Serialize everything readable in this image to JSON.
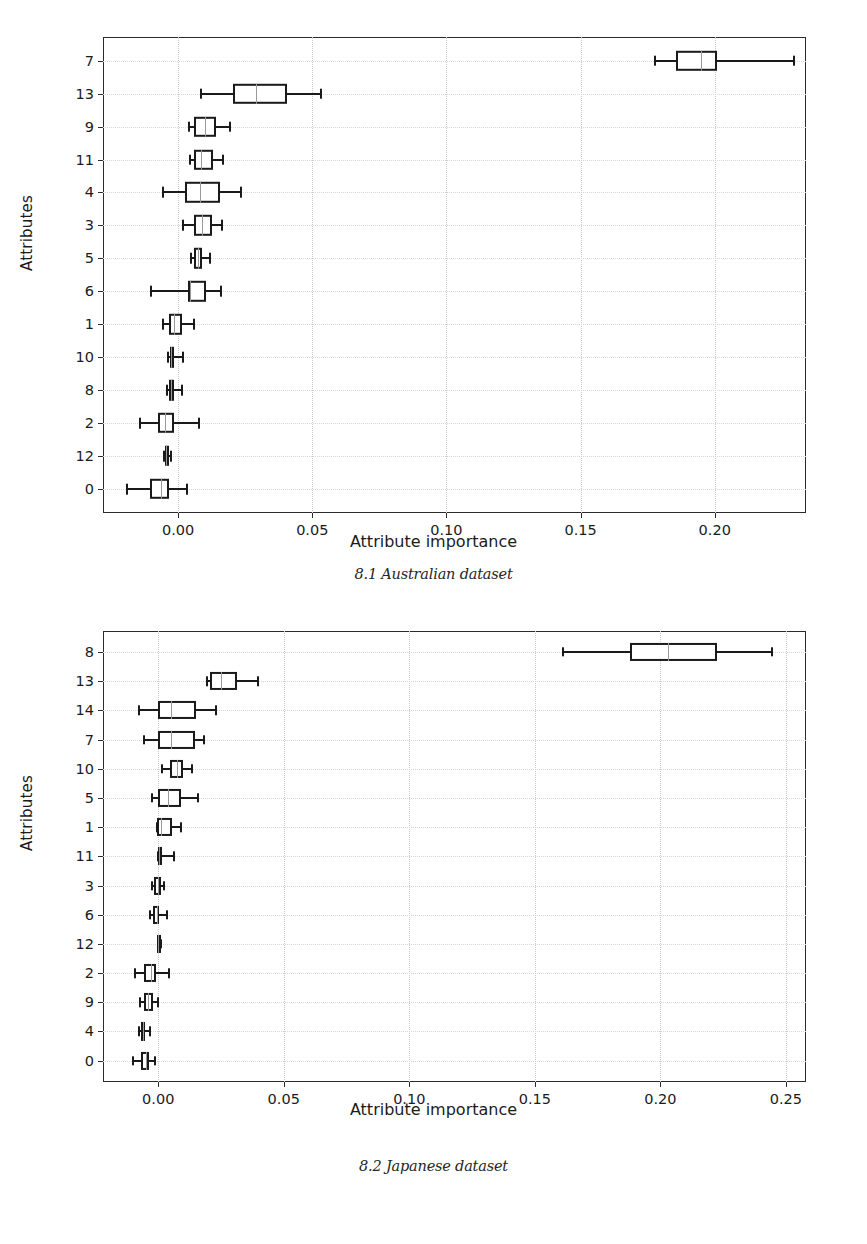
{
  "page": {
    "background": "#ffffff",
    "line_color": "#1a1a1a",
    "grid_color": "#cfcfcf"
  },
  "figures": [
    {
      "id": "australian",
      "caption": "8.1 Australian dataset",
      "xlabel": "Attribute importance",
      "ylabel": "Attributes",
      "chart_data": {
        "type": "box",
        "orientation": "horizontal",
        "title": "",
        "xlabel": "Attribute importance",
        "ylabel": "Attributes",
        "xlim": [
          -0.028,
          0.234
        ],
        "xticks": [
          0.0,
          0.05,
          0.1,
          0.15,
          0.2
        ],
        "xticklabels": [
          "0.00",
          "0.05",
          "0.10",
          "0.15",
          "0.20"
        ],
        "grid": true,
        "categories": [
          "7",
          "13",
          "9",
          "11",
          "4",
          "3",
          "5",
          "6",
          "1",
          "10",
          "8",
          "2",
          "12",
          "0"
        ],
        "boxes": [
          {
            "category": "7",
            "whisker_low": 0.1775,
            "q1": 0.1855,
            "median": 0.195,
            "q3": 0.201,
            "whisker_high": 0.229
          },
          {
            "category": "13",
            "whisker_low": 0.008,
            "q1": 0.0205,
            "median": 0.029,
            "q3": 0.0405,
            "whisker_high": 0.053
          },
          {
            "category": "9",
            "whisker_low": 0.0035,
            "q1": 0.006,
            "median": 0.01,
            "q3": 0.014,
            "whisker_high": 0.019
          },
          {
            "category": "11",
            "whisker_low": 0.004,
            "q1": 0.006,
            "median": 0.0085,
            "q3": 0.013,
            "whisker_high": 0.0165
          },
          {
            "category": "4",
            "whisker_low": -0.006,
            "q1": 0.0025,
            "median": 0.008,
            "q3": 0.0155,
            "whisker_high": 0.023
          },
          {
            "category": "3",
            "whisker_low": 0.0015,
            "q1": 0.006,
            "median": 0.009,
            "q3": 0.0125,
            "whisker_high": 0.016
          },
          {
            "category": "5",
            "whisker_low": 0.0045,
            "q1": 0.006,
            "median": 0.0075,
            "q3": 0.009,
            "whisker_high": 0.0115
          },
          {
            "category": "6",
            "whisker_low": -0.0105,
            "q1": 0.0035,
            "median": 0.0045,
            "q3": 0.0105,
            "whisker_high": 0.0155
          },
          {
            "category": "1",
            "whisker_low": -0.006,
            "q1": -0.0035,
            "median": -0.0015,
            "q3": 0.0015,
            "whisker_high": 0.0055
          },
          {
            "category": "10",
            "whisker_low": -0.004,
            "q1": -0.003,
            "median": -0.0025,
            "q3": -0.0015,
            "whisker_high": 0.0015
          },
          {
            "category": "8",
            "whisker_low": -0.0045,
            "q1": -0.0035,
            "median": -0.0025,
            "q3": -0.0015,
            "whisker_high": 0.001
          },
          {
            "category": "2",
            "whisker_low": -0.0145,
            "q1": -0.0075,
            "median": -0.005,
            "q3": -0.0015,
            "whisker_high": 0.0075
          },
          {
            "category": "12",
            "whisker_low": -0.0055,
            "q1": -0.005,
            "median": -0.0045,
            "q3": -0.0035,
            "whisker_high": -0.003
          },
          {
            "category": "0",
            "whisker_low": -0.0195,
            "q1": -0.0105,
            "median": -0.0065,
            "q3": -0.0035,
            "whisker_high": 0.003
          }
        ]
      }
    },
    {
      "id": "japanese",
      "caption": "8.2 Japanese dataset",
      "xlabel": "Attribute importance",
      "ylabel": "Attributes",
      "chart_data": {
        "type": "box",
        "orientation": "horizontal",
        "title": "",
        "xlabel": "Attribute importance",
        "ylabel": "Attributes",
        "xlim": [
          -0.022,
          0.258
        ],
        "xticks": [
          0.0,
          0.05,
          0.1,
          0.15,
          0.2,
          0.25
        ],
        "xticklabels": [
          "0.00",
          "0.05",
          "0.10",
          "0.15",
          "0.20",
          "0.25"
        ],
        "grid": true,
        "categories": [
          "8",
          "13",
          "14",
          "7",
          "10",
          "5",
          "1",
          "11",
          "3",
          "6",
          "12",
          "2",
          "9",
          "4",
          "0"
        ],
        "boxes": [
          {
            "category": "8",
            "whisker_low": 0.161,
            "q1": 0.188,
            "median": 0.203,
            "q3": 0.2225,
            "whisker_high": 0.244
          },
          {
            "category": "13",
            "whisker_low": 0.019,
            "q1": 0.0205,
            "median": 0.025,
            "q3": 0.0315,
            "whisker_high": 0.0395
          },
          {
            "category": "14",
            "whisker_low": -0.008,
            "q1": 0.0,
            "median": 0.005,
            "q3": 0.015,
            "whisker_high": 0.0225
          },
          {
            "category": "7",
            "whisker_low": -0.006,
            "q1": 0.0,
            "median": 0.005,
            "q3": 0.0145,
            "whisker_high": 0.018
          },
          {
            "category": "10",
            "whisker_low": 0.001,
            "q1": 0.0045,
            "median": 0.0075,
            "q3": 0.01,
            "whisker_high": 0.013
          },
          {
            "category": "5",
            "whisker_low": -0.003,
            "q1": 0.0,
            "median": 0.004,
            "q3": 0.009,
            "whisker_high": 0.0155
          },
          {
            "category": "1",
            "whisker_low": -0.001,
            "q1": -0.0005,
            "median": 0.001,
            "q3": 0.0055,
            "whisker_high": 0.0085
          },
          {
            "category": "11",
            "whisker_low": -0.0005,
            "q1": 0.0,
            "median": 0.0005,
            "q3": 0.0015,
            "whisker_high": 0.006
          },
          {
            "category": "3",
            "whisker_low": -0.003,
            "q1": -0.0015,
            "median": 0.0,
            "q3": 0.001,
            "whisker_high": 0.002
          },
          {
            "category": "6",
            "whisker_low": -0.0035,
            "q1": -0.002,
            "median": -0.0005,
            "q3": 0.0005,
            "whisker_high": 0.003
          },
          {
            "category": "12",
            "whisker_low": -0.0005,
            "q1": -0.0003,
            "median": 0.0,
            "q3": 0.0005,
            "whisker_high": 0.0008
          },
          {
            "category": "2",
            "whisker_low": -0.0095,
            "q1": -0.0055,
            "median": -0.003,
            "q3": -0.001,
            "whisker_high": 0.004
          },
          {
            "category": "9",
            "whisker_low": -0.0075,
            "q1": -0.0055,
            "median": -0.004,
            "q3": -0.002,
            "whisker_high": -0.0005
          },
          {
            "category": "4",
            "whisker_low": -0.008,
            "q1": -0.007,
            "median": -0.006,
            "q3": -0.0052,
            "whisker_high": -0.0035
          },
          {
            "category": "0",
            "whisker_low": -0.0105,
            "q1": -0.007,
            "median": -0.005,
            "q3": -0.0035,
            "whisker_high": -0.0015
          }
        ]
      }
    }
  ]
}
